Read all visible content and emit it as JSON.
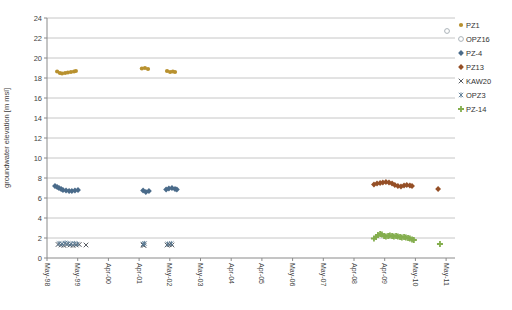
{
  "figure": {
    "width": 512,
    "height": 310,
    "background": "#ffffff",
    "gridline_color": "#c6c6c6",
    "axis_color": "#8a8a8a",
    "tick_text_color": "#3f3f3f",
    "legend_text_color": "#333333"
  },
  "chart_data": {
    "type": "scatter",
    "title": "",
    "xlabel": "",
    "ylabel": "groundwater elevation [m msl]",
    "ylim": [
      0,
      24
    ],
    "y_tick_step": 2,
    "y_ticks": [
      0,
      2,
      4,
      6,
      8,
      10,
      12,
      14,
      16,
      18,
      20,
      22,
      24
    ],
    "x_tick_labels": [
      "May-98",
      "May-99",
      "Apr-00",
      "Apr-01",
      "May-02",
      "May-03",
      "Apr-04",
      "Apr-05",
      "May-06",
      "May-07",
      "Apr-08",
      "Apr-09",
      "May-10",
      "May-11"
    ],
    "grid": true,
    "legend_position": "right",
    "series": [
      {
        "name": "PZ1",
        "marker": "circle",
        "color": "#b8912f",
        "points": [
          [
            0.33,
            18.65
          ],
          [
            0.42,
            18.5
          ],
          [
            0.49,
            18.45
          ],
          [
            0.59,
            18.5
          ],
          [
            0.68,
            18.55
          ],
          [
            0.78,
            18.6
          ],
          [
            0.88,
            18.65
          ],
          [
            0.94,
            18.7
          ],
          [
            3.09,
            18.95
          ],
          [
            3.19,
            19.0
          ],
          [
            3.29,
            18.9
          ],
          [
            3.91,
            18.7
          ],
          [
            4.01,
            18.6
          ],
          [
            4.1,
            18.65
          ],
          [
            4.17,
            18.6
          ]
        ]
      },
      {
        "name": "OPZ16",
        "marker": "circle-open",
        "color": "#aab2b8",
        "points": [
          [
            13.03,
            22.7
          ]
        ]
      },
      {
        "name": "PZ-4",
        "marker": "diamond",
        "color": "#4a6b8a",
        "points": [
          [
            0.26,
            7.2
          ],
          [
            0.33,
            7.1
          ],
          [
            0.39,
            7.0
          ],
          [
            0.46,
            6.9
          ],
          [
            0.52,
            6.8
          ],
          [
            0.62,
            6.75
          ],
          [
            0.72,
            6.7
          ],
          [
            0.81,
            6.7
          ],
          [
            0.91,
            6.75
          ],
          [
            1.01,
            6.8
          ],
          [
            3.13,
            6.75
          ],
          [
            3.22,
            6.6
          ],
          [
            3.32,
            6.7
          ],
          [
            3.88,
            6.85
          ],
          [
            3.97,
            6.95
          ],
          [
            4.07,
            7.0
          ],
          [
            4.17,
            6.9
          ],
          [
            4.23,
            6.85
          ]
        ]
      },
      {
        "name": "PZ13",
        "marker": "diamond",
        "color": "#954f26",
        "points": [
          [
            10.65,
            7.35
          ],
          [
            10.75,
            7.45
          ],
          [
            10.85,
            7.5
          ],
          [
            10.94,
            7.55
          ],
          [
            11.04,
            7.6
          ],
          [
            11.14,
            7.55
          ],
          [
            11.24,
            7.45
          ],
          [
            11.33,
            7.3
          ],
          [
            11.43,
            7.2
          ],
          [
            11.53,
            7.15
          ],
          [
            11.63,
            7.25
          ],
          [
            11.72,
            7.3
          ],
          [
            11.82,
            7.25
          ],
          [
            11.89,
            7.2
          ],
          [
            12.74,
            6.9
          ]
        ]
      },
      {
        "name": "KAW20",
        "marker": "x",
        "color": "#44484f",
        "points": [
          [
            0.36,
            1.35
          ],
          [
            0.46,
            1.3
          ],
          [
            0.55,
            1.25
          ],
          [
            0.65,
            1.35
          ],
          [
            0.75,
            1.3
          ],
          [
            0.85,
            1.25
          ],
          [
            0.95,
            1.3
          ],
          [
            1.05,
            1.35
          ],
          [
            1.27,
            1.3
          ],
          [
            3.13,
            1.3
          ],
          [
            3.16,
            1.25
          ],
          [
            3.91,
            1.3
          ],
          [
            3.98,
            1.35
          ],
          [
            4.07,
            1.3
          ]
        ]
      },
      {
        "name": "OPZ3",
        "marker": "asterisk",
        "color": "#5a7a94",
        "points": [
          [
            0.39,
            1.45
          ],
          [
            0.49,
            1.4
          ],
          [
            0.59,
            1.5
          ],
          [
            0.69,
            1.45
          ],
          [
            0.79,
            1.4
          ],
          [
            0.89,
            1.45
          ],
          [
            0.99,
            1.4
          ],
          [
            3.13,
            1.4
          ],
          [
            3.18,
            1.45
          ],
          [
            3.93,
            1.4
          ],
          [
            4.05,
            1.45
          ]
        ]
      },
      {
        "name": "PZ-14",
        "marker": "plus",
        "color": "#84ae4e",
        "points": [
          [
            10.65,
            1.95
          ],
          [
            10.72,
            2.1
          ],
          [
            10.78,
            2.3
          ],
          [
            10.85,
            2.4
          ],
          [
            10.91,
            2.35
          ],
          [
            10.98,
            2.2
          ],
          [
            11.04,
            2.15
          ],
          [
            11.11,
            2.2
          ],
          [
            11.17,
            2.25
          ],
          [
            11.24,
            2.2
          ],
          [
            11.3,
            2.15
          ],
          [
            11.37,
            2.2
          ],
          [
            11.43,
            2.15
          ],
          [
            11.5,
            2.1
          ],
          [
            11.56,
            2.05
          ],
          [
            11.63,
            2.1
          ],
          [
            11.69,
            2.05
          ],
          [
            11.76,
            2.0
          ],
          [
            11.82,
            1.95
          ],
          [
            11.89,
            1.85
          ],
          [
            11.95,
            1.8
          ],
          [
            12.8,
            1.4
          ]
        ]
      }
    ]
  },
  "legend": {
    "items": [
      {
        "label": "PZ1",
        "marker": "circle",
        "color": "#b8912f"
      },
      {
        "label": "OPZ16",
        "marker": "circle-open",
        "color": "#aab2b8"
      },
      {
        "label": "PZ-4",
        "marker": "diamond",
        "color": "#4a6b8a"
      },
      {
        "label": "PZ13",
        "marker": "diamond",
        "color": "#954f26"
      },
      {
        "label": "KAW20",
        "marker": "x",
        "color": "#44484f"
      },
      {
        "label": "OPZ3",
        "marker": "asterisk",
        "color": "#5a7a94"
      },
      {
        "label": "PZ-14",
        "marker": "plus",
        "color": "#84ae4e"
      }
    ]
  }
}
